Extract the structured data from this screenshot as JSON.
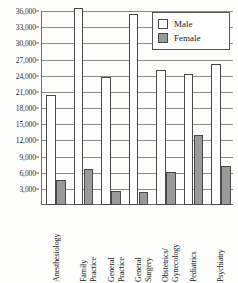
{
  "chart_data": {
    "type": "bar",
    "title": "",
    "xlabel": "",
    "ylabel": "",
    "ylim": [
      0,
      36000
    ],
    "grid": true,
    "legend_position": "top-right",
    "categories": [
      "Anesthesiology",
      "Family Practice",
      "General Practice",
      "General Surgery",
      "Obstetrics/ Gynecology",
      "Pediatrics",
      "Psychiatry"
    ],
    "category_lines": [
      [
        "Anesthesiology",
        ""
      ],
      [
        "Family",
        "Practice"
      ],
      [
        "General",
        "Practice"
      ],
      [
        "General",
        "Surgery"
      ],
      [
        "Obstetrics/",
        "Gynecology"
      ],
      [
        "Pediatrics",
        ""
      ],
      [
        "Psychiatry",
        ""
      ]
    ],
    "ytick_labels": [
      "3,000",
      "6,000",
      "9,000",
      "12,000",
      "15,000",
      "18,000",
      "21,000",
      "24,000",
      "27,000",
      "30,000",
      "33,000",
      "36,000"
    ],
    "ytick_values": [
      3000,
      6000,
      9000,
      12000,
      15000,
      18000,
      21000,
      24000,
      27000,
      30000,
      33000,
      36000
    ],
    "series": [
      {
        "name": "Male",
        "color": "#ffffff",
        "values": [
          20500,
          36500,
          23800,
          35400,
          25100,
          24400,
          26100
        ]
      },
      {
        "name": "Female",
        "color": "#9a9a9a",
        "values": [
          4700,
          6700,
          2600,
          2500,
          6200,
          13000,
          7200
        ]
      }
    ]
  },
  "legend": {
    "items": [
      {
        "label": "Male",
        "swatch": "male"
      },
      {
        "label": "Female",
        "swatch": "female"
      }
    ]
  }
}
